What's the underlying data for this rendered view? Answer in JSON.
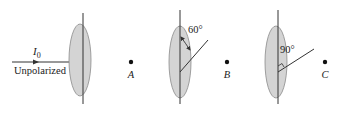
{
  "diagram": {
    "incident": {
      "intensity_label": "I",
      "intensity_subscript": "0",
      "polarization_label": "Unpolarized"
    },
    "polarizers": [
      {
        "id": "polarizer-1",
        "axis_angle_label": ""
      },
      {
        "id": "polarizer-2",
        "axis_angle_label": "60°"
      },
      {
        "id": "polarizer-3",
        "axis_angle_label": "90°"
      }
    ],
    "points": [
      {
        "id": "A",
        "label": "A"
      },
      {
        "id": "B",
        "label": "B"
      },
      {
        "id": "C",
        "label": "C"
      }
    ],
    "colors": {
      "polarizer_fill": "#d4d4d4",
      "polarizer_edge": "#8a8a8a",
      "line": "#333333",
      "dot": "#111111"
    }
  }
}
